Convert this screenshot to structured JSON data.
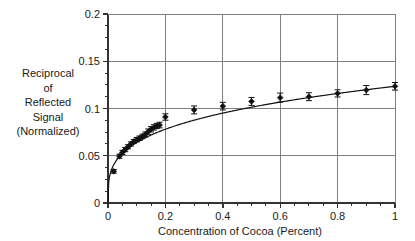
{
  "chart_data": {
    "type": "scatter",
    "title": "",
    "xlabel": "Concentration of Cocoa (Percent)",
    "ylabel": "Reciprocal of Reflected Signal (Normalized)",
    "ylabel_lines": [
      "Reciprocal",
      "of",
      "Reflected",
      "Signal",
      "(Normalized)"
    ],
    "xlim": [
      0,
      1
    ],
    "ylim": [
      0,
      0.2
    ],
    "xticks": [
      0,
      0.2,
      0.4,
      0.6,
      0.8,
      1
    ],
    "xtick_labels": [
      "0",
      "0.2",
      "0.4",
      "0.6",
      "0.8",
      "1"
    ],
    "xminor_step": 0.05,
    "yticks": [
      0,
      0.05,
      0.1,
      0.15,
      0.2
    ],
    "ytick_labels": [
      "0",
      "0.05",
      "0.1",
      "0.15",
      "0.2"
    ],
    "yminor_step": 0.0125,
    "grid": true,
    "grid_axis": "both",
    "legend": "none",
    "marker": "filled-diamond",
    "marker_color": "#111111",
    "line_color": "#111111",
    "grid_color": "#808080",
    "axis_color": "#333333",
    "series": [
      {
        "name": "Reciprocal of reflected signal",
        "x": [
          0.02,
          0.04,
          0.05,
          0.06,
          0.07,
          0.08,
          0.09,
          0.1,
          0.11,
          0.12,
          0.13,
          0.14,
          0.15,
          0.16,
          0.17,
          0.18,
          0.2,
          0.3,
          0.4,
          0.5,
          0.6,
          0.7,
          0.8,
          0.9,
          1.0
        ],
        "y": [
          0.0335,
          0.0495,
          0.0535,
          0.0565,
          0.0595,
          0.0625,
          0.065,
          0.067,
          0.0685,
          0.0705,
          0.0725,
          0.0755,
          0.078,
          0.08,
          0.0815,
          0.0825,
          0.091,
          0.0985,
          0.1025,
          0.1075,
          0.1115,
          0.1125,
          0.116,
          0.1195,
          0.1235
        ],
        "yerr": [
          0.002,
          0.0022,
          0.0022,
          0.0022,
          0.0022,
          0.0022,
          0.0022,
          0.0024,
          0.0024,
          0.0024,
          0.0026,
          0.0028,
          0.0028,
          0.0028,
          0.0028,
          0.003,
          0.0034,
          0.0042,
          0.004,
          0.0042,
          0.0048,
          0.0042,
          0.0038,
          0.0048,
          0.004
        ]
      }
    ],
    "fit_curve": {
      "name": "power-law fit",
      "description": "y = 0.1235 * x^0.285",
      "amplitude": 0.1235,
      "exponent": 0.285
    }
  }
}
